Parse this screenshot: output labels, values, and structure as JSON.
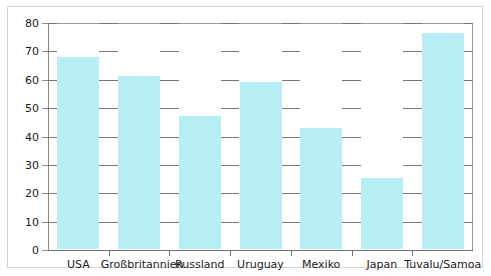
{
  "chart_data": {
    "type": "bar",
    "title": "",
    "xlabel": "",
    "ylabel": "",
    "categories": [
      "USA",
      "Großbritannien",
      "Russland",
      "Uruguay",
      "Mexiko",
      "Japan",
      "Tuvalu/Samoa"
    ],
    "values": [
      67.5,
      61,
      47,
      59,
      42.5,
      25,
      76
    ],
    "ylim": [
      0,
      80
    ],
    "yticks": [
      0,
      10,
      20,
      30,
      40,
      50,
      60,
      70,
      80
    ],
    "ytick_labels": [
      "0",
      "10",
      "20",
      "30",
      "40",
      "50",
      "60",
      "70",
      "80"
    ],
    "grid": true,
    "legend": false,
    "bar_color": "#b7edf4",
    "axis_color": "#6f6f6f",
    "grid_color": "#777777",
    "text_color": "#1b1b1b",
    "frame_color": "#d4d4d4"
  }
}
